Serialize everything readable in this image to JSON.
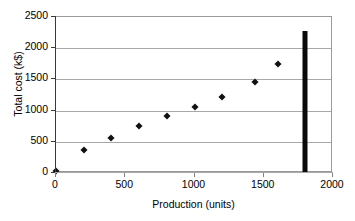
{
  "chart_data": {
    "type": "scatter",
    "title": "",
    "xlabel": "Production (units)",
    "ylabel": "Total cost (k$)",
    "xlim": [
      0,
      2000
    ],
    "ylim": [
      0,
      2500
    ],
    "xticks": [
      0,
      500,
      1000,
      1500,
      2000
    ],
    "yticks": [
      0,
      500,
      1000,
      1500,
      2000,
      2500
    ],
    "xtick_labels": [
      "0",
      "500",
      "1000",
      "1500",
      "2000"
    ],
    "ytick_labels": [
      "0",
      "500",
      "1000",
      "1500",
      "2000",
      "2500"
    ],
    "grid": "horizontal",
    "legend": "none",
    "marker": "diamond",
    "marker_color": "#111111",
    "gridline_color": "#a8a8a8",
    "axis_color": "#3a3a3a",
    "series": [
      {
        "name": "Total cost",
        "x": [
          0,
          200,
          400,
          600,
          800,
          1000,
          1200,
          1440,
          1600
        ],
        "y": [
          25,
          370,
          565,
          750,
          915,
          1065,
          1225,
          1460,
          1750
        ]
      }
    ],
    "annotations": [
      {
        "name": "capacity-bar",
        "type": "vertical-bar",
        "x": 1800,
        "y_bottom": 0,
        "y_top": 2270,
        "color": "#0a0a0a"
      }
    ]
  }
}
